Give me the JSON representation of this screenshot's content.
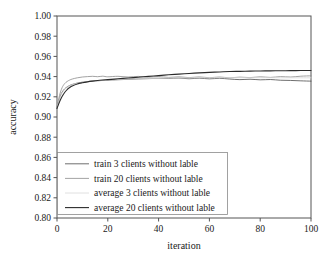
{
  "chart_data": {
    "type": "line",
    "title": "",
    "xlabel": "iteration",
    "ylabel": "accuracy",
    "xlim": [
      0,
      100
    ],
    "ylim": [
      0.8,
      1.0
    ],
    "grid": false,
    "legend_position": "lower-left-inside",
    "xticks": [
      "0",
      "20",
      "40",
      "60",
      "80",
      "100"
    ],
    "xtick_values": [
      0,
      20,
      40,
      60,
      80,
      100
    ],
    "yticks": [
      "0.80",
      "0.82",
      "0.84",
      "0.86",
      "0.88",
      "0.90",
      "0.92",
      "0.94",
      "0.96",
      "0.98",
      "1.00"
    ],
    "ytick_values": [
      0.8,
      0.82,
      0.84,
      0.86,
      0.88,
      0.9,
      0.92,
      0.94,
      0.96,
      0.98,
      1.0
    ],
    "x": [
      0,
      1,
      2,
      3,
      4,
      5,
      6,
      8,
      10,
      12,
      14,
      16,
      18,
      20,
      24,
      28,
      32,
      36,
      40,
      44,
      48,
      52,
      56,
      60,
      64,
      68,
      72,
      76,
      80,
      84,
      88,
      92,
      96,
      100
    ],
    "series": [
      {
        "name": "train 3 clients without lable",
        "color": "#4a4a4a",
        "width": 0.8,
        "final_value": 0.9355,
        "values": [
          0.909,
          0.9188,
          0.9245,
          0.9278,
          0.9298,
          0.9312,
          0.9322,
          0.9336,
          0.9345,
          0.9351,
          0.9356,
          0.9359,
          0.9362,
          0.9365,
          0.9369,
          0.9373,
          0.9377,
          0.938,
          0.9383,
          0.9381,
          0.9385,
          0.9379,
          0.9384,
          0.9378,
          0.9383,
          0.9376,
          0.937,
          0.9374,
          0.9368,
          0.9371,
          0.9364,
          0.9362,
          0.9358,
          0.9355
        ]
      },
      {
        "name": "train 20 clients without lable",
        "color": "#8c8c8c",
        "width": 0.8,
        "final_value": 0.9408,
        "values": [
          0.9092,
          0.9215,
          0.929,
          0.933,
          0.9352,
          0.9366,
          0.9376,
          0.9388,
          0.9396,
          0.94,
          0.9403,
          0.9399,
          0.9404,
          0.9398,
          0.9403,
          0.9396,
          0.9402,
          0.9394,
          0.94,
          0.9392,
          0.9398,
          0.939,
          0.9397,
          0.9389,
          0.9396,
          0.9388,
          0.9395,
          0.939,
          0.9398,
          0.9392,
          0.94,
          0.9396,
          0.9404,
          0.9408
        ]
      },
      {
        "name": "average 3 clients without lable",
        "color": "#d8d8d8",
        "width": 0.8,
        "final_value": 0.9388,
        "values": [
          0.909,
          0.9182,
          0.9238,
          0.9272,
          0.9294,
          0.9309,
          0.932,
          0.9334,
          0.9343,
          0.935,
          0.9355,
          0.9359,
          0.9363,
          0.9366,
          0.9371,
          0.9375,
          0.9378,
          0.9381,
          0.9383,
          0.9385,
          0.9386,
          0.9387,
          0.9388,
          0.9388,
          0.9389,
          0.9389,
          0.9389,
          0.9389,
          0.9389,
          0.9389,
          0.9388,
          0.9388,
          0.9388,
          0.9388
        ]
      },
      {
        "name": "average 20 clients without lable",
        "color": "#2b2b2b",
        "width": 1.1,
        "final_value": 0.946,
        "values": [
          0.9085,
          0.915,
          0.9203,
          0.9243,
          0.9272,
          0.9292,
          0.9307,
          0.9327,
          0.9339,
          0.9348,
          0.9355,
          0.9361,
          0.9366,
          0.937,
          0.9378,
          0.9386,
          0.9394,
          0.9402,
          0.941,
          0.9418,
          0.9425,
          0.9431,
          0.9437,
          0.9442,
          0.9446,
          0.945,
          0.9452,
          0.9454,
          0.9456,
          0.9457,
          0.9458,
          0.9459,
          0.946,
          0.946
        ]
      }
    ]
  },
  "legend": {
    "entries": [
      "train 3 clients without lable",
      "train 20 clients without lable",
      "average 3 clients without lable",
      "average 20 clients without lable"
    ]
  }
}
